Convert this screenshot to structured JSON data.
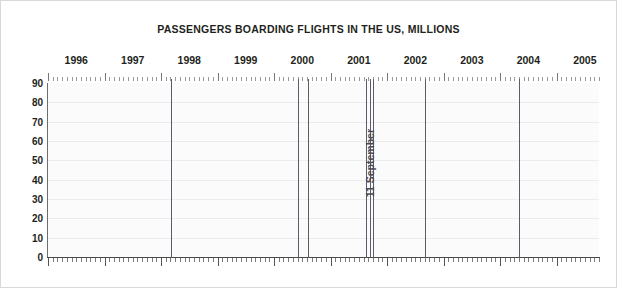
{
  "chart_data": {
    "type": "area",
    "title": "PASSENGERS BOARDING FLIGHTS IN THE US, MILLIONS",
    "xlabel": "",
    "ylabel": "",
    "ylim": [
      0,
      90
    ],
    "ytick_step": 10,
    "yticks": [
      "0",
      "10",
      "20",
      "30",
      "40",
      "50",
      "60",
      "70",
      "80",
      "90"
    ],
    "xticks": [
      "1996",
      "1997",
      "1998",
      "1999",
      "2000",
      "2001",
      "2002",
      "2003",
      "2004",
      "2005"
    ],
    "xlim_start": 1996.0,
    "xlim_end": 2005.75,
    "grid": true,
    "legend": null,
    "annotations": [
      {
        "label": "11 September",
        "x": 2001.7,
        "orientation": "vertical"
      }
    ],
    "event_lines": [
      {
        "x": 1998.17
      },
      {
        "x": 2000.42
      },
      {
        "x": 2000.6
      },
      {
        "x": 2001.62
      },
      {
        "x": 2001.7
      },
      {
        "x": 2001.75
      },
      {
        "x": 2002.67
      },
      {
        "x": 2004.33
      }
    ],
    "series": [
      {
        "name": "Passengers boarding flights in the US",
        "units": "millions",
        "x": [
          1996.0,
          1996.08,
          1996.17,
          1996.25,
          1996.33,
          1996.42,
          1996.5,
          1996.58,
          1996.67,
          1996.75,
          1996.83,
          1996.92,
          1997.0,
          1997.08,
          1997.17,
          1997.25,
          1997.33,
          1997.42,
          1997.5,
          1997.58,
          1997.67,
          1997.75,
          1997.83,
          1997.92,
          1998.0,
          1998.08,
          1998.17,
          1998.25,
          1998.33,
          1998.42,
          1998.5,
          1998.58,
          1998.67,
          1998.75,
          1998.83,
          1998.92,
          1999.0,
          1999.08,
          1999.17,
          1999.25,
          1999.33,
          1999.42,
          1999.5,
          1999.58,
          1999.67,
          1999.75,
          1999.83,
          1999.92,
          2000.0,
          2000.08,
          2000.17,
          2000.25,
          2000.33,
          2000.42,
          2000.5,
          2000.58,
          2000.67,
          2000.75,
          2000.83,
          2000.92,
          2001.0,
          2001.08,
          2001.17,
          2001.25,
          2001.33,
          2001.42,
          2001.5,
          2001.58,
          2001.67,
          2001.75,
          2001.83,
          2001.92,
          2002.0,
          2002.08,
          2002.17,
          2002.25,
          2002.33,
          2002.42,
          2002.5,
          2002.58,
          2002.67,
          2002.75,
          2002.83,
          2002.92,
          2003.0,
          2003.08,
          2003.17,
          2003.25,
          2003.33,
          2003.42,
          2003.5,
          2003.58,
          2003.67,
          2003.75,
          2003.83,
          2003.92,
          2004.0,
          2004.08,
          2004.17,
          2004.25,
          2004.33,
          2004.42,
          2004.5,
          2004.58,
          2004.67,
          2004.75,
          2004.83,
          2004.92,
          2005.0,
          2005.08,
          2005.17,
          2005.25,
          2005.33,
          2005.42,
          2005.5,
          2005.58,
          2005.67
        ],
        "values": [
          46,
          45,
          54,
          52,
          55,
          57,
          58,
          57,
          52,
          56,
          53,
          54,
          52,
          49,
          58,
          56,
          57,
          60,
          61,
          59,
          54,
          58,
          55,
          57,
          54,
          51,
          59,
          57,
          59,
          62,
          63,
          62,
          56,
          60,
          57,
          59,
          56,
          53,
          61,
          59,
          62,
          65,
          66,
          64,
          58,
          63,
          60,
          63,
          59,
          56,
          65,
          63,
          66,
          69,
          70,
          68,
          62,
          67,
          63,
          66,
          62,
          58,
          67,
          64,
          67,
          70,
          71,
          69,
          43,
          46,
          49,
          51,
          50,
          48,
          56,
          55,
          58,
          61,
          63,
          61,
          55,
          60,
          57,
          60,
          56,
          52,
          58,
          55,
          59,
          64,
          66,
          65,
          59,
          63,
          61,
          64,
          62,
          60,
          68,
          66,
          69,
          72,
          74,
          73,
          66,
          70,
          67,
          70,
          66,
          63,
          72,
          70,
          74,
          78,
          79,
          72,
          67
        ]
      }
    ]
  },
  "style": {
    "line_color": "#a8a8ad",
    "fill_color": "#f0f0f2",
    "event_line_color": "#5b5b6a",
    "axis_color": "#4a4a4a",
    "grid_color": "#ececec",
    "text_color": "#231f20"
  }
}
